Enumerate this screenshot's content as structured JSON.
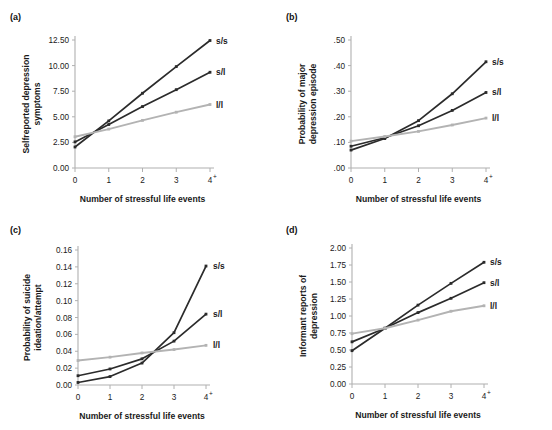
{
  "figure": {
    "xlabel": "Number of stressful life events",
    "x_tick_labels": [
      "0",
      "1",
      "2",
      "3",
      "4"
    ],
    "x_last_superscript": "+",
    "series_names": [
      "s/s",
      "s/l",
      "l/l"
    ],
    "colors": {
      "s/s": "#2b2b2b",
      "s/l": "#2b2b2b",
      "l/l": "#b3b3b3",
      "axis": "#b0b0b0",
      "text": "#1a1a1a"
    }
  },
  "panels": [
    {
      "tag": "(a)",
      "ylabel": "Selfreported depression\nsymptoms",
      "ylabel_line1": "Selfreported depression",
      "ylabel_line2": "symptoms",
      "y_tick_labels": [
        "0.00",
        "2.50",
        "5.00",
        "7.50",
        "10.00",
        "12.50"
      ],
      "chart_data": {
        "type": "line",
        "title": "(a) Selfreported depression symptoms",
        "xlabel": "Number of stressful life events",
        "ylabel": "Selfreported depression symptoms",
        "x": [
          0,
          1,
          2,
          3,
          4
        ],
        "xtick_labels": [
          "0",
          "1",
          "2",
          "3",
          "4+"
        ],
        "ylim": [
          0,
          12.5
        ],
        "yticks": [
          0.0,
          2.5,
          5.0,
          7.5,
          10.0,
          12.5
        ],
        "grid": false,
        "legend": "right-inline",
        "series": [
          {
            "name": "s/s",
            "values": [
              2.05,
              4.6,
              7.3,
              9.9,
              12.45
            ]
          },
          {
            "name": "s/l",
            "values": [
              2.55,
              4.25,
              6.0,
              7.65,
              9.35
            ]
          },
          {
            "name": "l/l",
            "values": [
              3.05,
              3.8,
              4.65,
              5.45,
              6.2
            ]
          }
        ]
      }
    },
    {
      "tag": "(b)",
      "ylabel_line1": "Probability of major",
      "ylabel_line2": "depression episode",
      "y_tick_labels": [
        ".00",
        ".10",
        ".20",
        ".30",
        ".40",
        ".50"
      ],
      "chart_data": {
        "type": "line",
        "title": "(b) Probability of major depression episode",
        "xlabel": "Number of stressful life events",
        "ylabel": "Probability of major depression episode",
        "x": [
          0,
          1,
          2,
          3,
          4
        ],
        "xtick_labels": [
          "0",
          "1",
          "2",
          "3",
          "4+"
        ],
        "ylim": [
          0,
          0.5
        ],
        "yticks": [
          0.0,
          0.1,
          0.2,
          0.3,
          0.4,
          0.5
        ],
        "grid": false,
        "legend": "right-inline",
        "series": [
          {
            "name": "s/s",
            "values": [
              0.07,
              0.115,
              0.185,
              0.29,
              0.415
            ]
          },
          {
            "name": "s/l",
            "values": [
              0.085,
              0.118,
              0.165,
              0.225,
              0.295
            ]
          },
          {
            "name": "l/l",
            "values": [
              0.105,
              0.123,
              0.143,
              0.168,
              0.195
            ]
          }
        ]
      }
    },
    {
      "tag": "(c)",
      "ylabel_line1": "Probability of suicide",
      "ylabel_line2": "ideation/attempt",
      "y_tick_labels": [
        "0.00",
        "0.02",
        "0.04",
        "0.06",
        "0.08",
        "0.10",
        "0.12",
        "0.14",
        "0.16"
      ],
      "chart_data": {
        "type": "line",
        "title": "(c) Probability of suicide ideation/attempt",
        "xlabel": "Number of stressful life events",
        "ylabel": "Probability of suicide ideation/attempt",
        "x": [
          0,
          1,
          2,
          3,
          4
        ],
        "xtick_labels": [
          "0",
          "1",
          "2",
          "3",
          "4+"
        ],
        "ylim": [
          0,
          0.16
        ],
        "yticks": [
          0.0,
          0.02,
          0.04,
          0.06,
          0.08,
          0.1,
          0.12,
          0.14,
          0.16
        ],
        "grid": false,
        "legend": "right-inline",
        "series": [
          {
            "name": "s/s",
            "values": [
              0.003,
              0.01,
              0.026,
              0.062,
              0.141
            ]
          },
          {
            "name": "s/l",
            "values": [
              0.011,
              0.019,
              0.031,
              0.052,
              0.084
            ]
          },
          {
            "name": "l/l",
            "values": [
              0.029,
              0.033,
              0.038,
              0.042,
              0.047
            ]
          }
        ]
      }
    },
    {
      "tag": "(d)",
      "ylabel_line1": "Informant reports of",
      "ylabel_line2": "depression",
      "y_tick_labels": [
        "0.00",
        "0.25",
        "0.50",
        "0.75",
        "1.00",
        "1.25",
        "1.50",
        "1.75",
        "2.00"
      ],
      "chart_data": {
        "type": "line",
        "title": "(d) Informant reports of depression",
        "xlabel": "Number of stressful life events",
        "ylabel": "Informant reports of depression",
        "x": [
          0,
          1,
          2,
          3,
          4
        ],
        "xtick_labels": [
          "0",
          "1",
          "2",
          "3",
          "4+"
        ],
        "ylim": [
          0,
          2.0
        ],
        "yticks": [
          0.0,
          0.25,
          0.5,
          0.75,
          1.0,
          1.25,
          1.5,
          1.75,
          2.0
        ],
        "grid": false,
        "legend": "right-inline",
        "series": [
          {
            "name": "s/s",
            "values": [
              0.49,
              0.82,
              1.16,
              1.48,
              1.79
            ]
          },
          {
            "name": "s/l",
            "values": [
              0.62,
              0.82,
              1.05,
              1.26,
              1.49
            ]
          },
          {
            "name": "l/l",
            "values": [
              0.74,
              0.82,
              0.94,
              1.07,
              1.15
            ]
          }
        ]
      }
    }
  ]
}
